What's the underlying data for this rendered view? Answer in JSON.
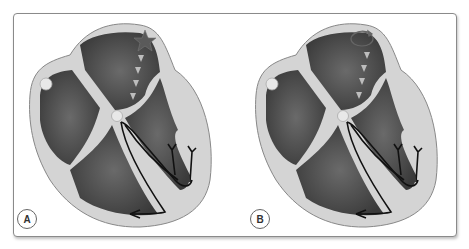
{
  "figure": {
    "panels": [
      {
        "label": "A",
        "origin_marker": "star-icon",
        "description": "Impulse originating from a focal point (star) in the left atrium, propagating toward AV node"
      },
      {
        "label": "B",
        "origin_marker": "reentry-circuit-icon",
        "description": "Impulse from a circular re-entry circuit in the left atrium, propagating toward AV node"
      }
    ]
  },
  "colors": {
    "frame_border": "#8a8a8a",
    "myocardium": "#d4d4d4",
    "chamber": "#4a4a4a",
    "conduction_path": "#111111",
    "impulse_arrows": "#bdbdbd"
  }
}
